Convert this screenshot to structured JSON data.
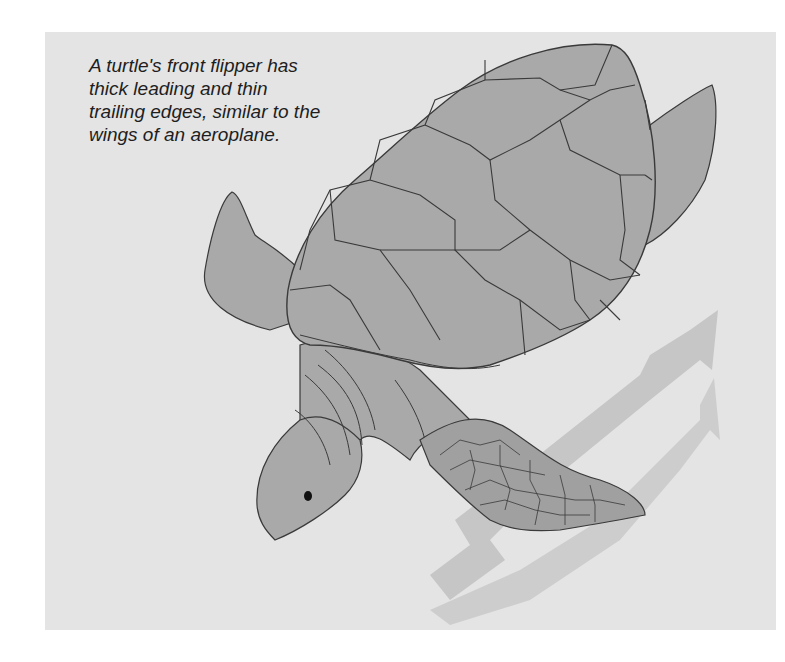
{
  "figure": {
    "caption_lines": [
      "A turtle's front flipper has",
      "thick leading and thin",
      "trailing edges, similar to the",
      "wings of an aeroplane."
    ],
    "elements": [
      "shell",
      "head",
      "left-rear-flipper",
      "right-rear-flipper",
      "front-flipper",
      "water-flow-arrows"
    ],
    "colors": {
      "page_background": "#ffffff",
      "panel_background": "#e4e4e4",
      "turtle_fill": "#a9a9a9",
      "outline": "#3a3a3a",
      "arrow_fill": "#b8b8b8"
    }
  }
}
